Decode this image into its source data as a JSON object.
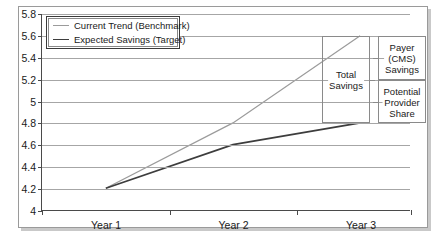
{
  "chart_data": {
    "type": "line",
    "title": "",
    "subtitle": "",
    "xlabel": "",
    "ylabel": "",
    "categories": [
      "Year 1",
      "Year 2",
      "Year 3"
    ],
    "ylim": [
      4,
      5.8
    ],
    "ytick_labels": [
      "5.8",
      "5.6",
      "5.4",
      "5.2",
      "5",
      "4.8",
      "4.6",
      "4.4",
      "4.2",
      "4"
    ],
    "ytick_values": [
      5.8,
      5.6,
      5.4,
      5.2,
      5.0,
      4.8,
      4.6,
      4.4,
      4.2,
      4.0
    ],
    "grid": true,
    "legend_position": "top-left",
    "series": [
      {
        "name": "Current Trend (Benchmark)",
        "values": [
          4.2,
          4.8,
          5.6
        ],
        "color": "#9b9b9b"
      },
      {
        "name": "Expected Savings (Target)",
        "values": [
          4.2,
          4.6,
          4.8
        ],
        "color": "#3d3d3d"
      }
    ],
    "annotations": [
      {
        "id": "total-savings",
        "label": "Total Savings",
        "label_lines": [
          "Total",
          "Savings"
        ],
        "from": 4.8,
        "to": 5.6
      },
      {
        "id": "payer-cms-savings",
        "label": "Payer (CMS) Savings",
        "label_lines": [
          "Payer",
          "(CMS)",
          "Savings"
        ],
        "from": 5.2,
        "to": 5.6
      },
      {
        "id": "potential-provider-share",
        "label": "Potential Provider Share",
        "label_lines": [
          "Potential",
          "Provider",
          "Share"
        ],
        "from": 4.8,
        "to": 5.2
      }
    ]
  },
  "legend": {
    "items": [
      {
        "label": "Current Trend (Benchmark)"
      },
      {
        "label": "Expected Savings (Target)"
      }
    ]
  },
  "axis": {
    "y": {
      "labels": [
        "5.8",
        "5.6",
        "5.4",
        "5.2",
        "5",
        "4.8",
        "4.6",
        "4.4",
        "4.2",
        "4"
      ]
    },
    "x": {
      "labels": [
        "Year 1",
        "Year 2",
        "Year 3"
      ]
    }
  },
  "annotations": {
    "total_savings": {
      "line1": "Total",
      "line2": "Savings"
    },
    "payer_savings": {
      "line1": "Payer",
      "line2": "(CMS)",
      "line3": "Savings"
    },
    "provider_share": {
      "line1": "Potential",
      "line2": "Provider",
      "line3": "Share"
    }
  }
}
